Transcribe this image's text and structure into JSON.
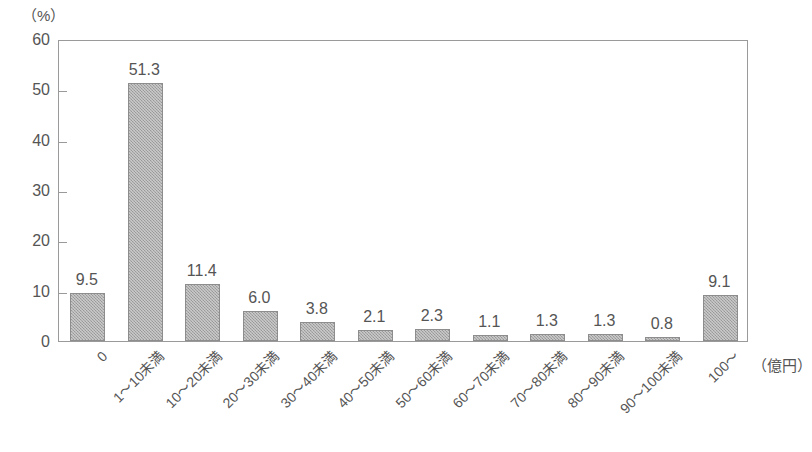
{
  "chart_data": {
    "type": "bar",
    "title": "",
    "subtitle": "",
    "xlabel": "（億円）",
    "ylabel": "（%）",
    "ylim": [
      0,
      60
    ],
    "ytick_values": [
      0,
      10,
      20,
      30,
      40,
      50,
      60
    ],
    "ytick_labels": [
      "0",
      "10",
      "20",
      "30",
      "40",
      "50",
      "60"
    ],
    "grid": false,
    "legend": null,
    "categories": [
      "0",
      "1〜10未満",
      "10〜20未満",
      "20〜30未満",
      "30〜40未満",
      "40〜50未満",
      "50〜60未満",
      "60〜70未満",
      "70〜80未満",
      "80〜90未満",
      "90〜100未満",
      "100〜"
    ],
    "values": [
      9.5,
      51.3,
      11.4,
      6.0,
      3.8,
      2.1,
      2.3,
      1.1,
      1.3,
      1.3,
      0.8,
      9.1
    ],
    "data_labels": [
      "9.5",
      "51.3",
      "11.4",
      "6.0",
      "3.8",
      "2.1",
      "2.3",
      "1.1",
      "1.3",
      "1.3",
      "0.8",
      "9.1"
    ],
    "bar_fill_color": "#a8a8a8",
    "bar_border_color": "#8d8d8d",
    "axis_color": "#9a9a9a",
    "text_color": "#555555",
    "background_color": "#ffffff"
  }
}
